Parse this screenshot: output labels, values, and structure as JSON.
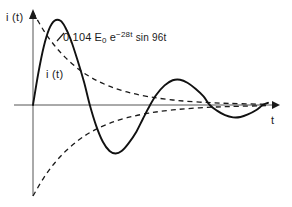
{
  "figure": {
    "background_color": "#ffffff",
    "ink_color": "#1a1a1a"
  },
  "axes": {
    "y_label": "i (t)",
    "t_label": "t",
    "y_arrow": "up-arrow",
    "t_arrow": "right-arrow"
  },
  "annotations": {
    "curve_label": "i (t)",
    "equation": {
      "coefficient": "0,104",
      "amplitude_symbol": "E",
      "amplitude_subscript": "0",
      "exp_base": "e",
      "exp_superscript": "−28t",
      "trig": "sin 96t",
      "full_text": "0,104 E0 e−28t sin 96t"
    }
  },
  "chart_data": {
    "type": "line",
    "title": "",
    "xlabel": "t",
    "ylabel": "i (t)",
    "grid": false,
    "legend": null,
    "axis_origin_px": [
      33,
      105
    ],
    "xlim": [
      0,
      0.175
    ],
    "ylim": [
      -1.05,
      1.05
    ],
    "series": [
      {
        "name": "i (t)",
        "style": "solid",
        "expression": "0,104 E0 e^(-28t) sin 96t",
        "points": [
          [
            0.0,
            0.0
          ],
          [
            0.004,
            0.345
          ],
          [
            0.008,
            0.627
          ],
          [
            0.012,
            0.816
          ],
          [
            0.016,
            0.906
          ],
          [
            0.0205,
            0.906
          ],
          [
            0.024,
            0.836
          ],
          [
            0.028,
            0.707
          ],
          [
            0.033,
            0.489
          ],
          [
            0.038,
            0.246
          ],
          [
            0.0423,
            0.0
          ],
          [
            0.047,
            -0.226
          ],
          [
            0.052,
            -0.404
          ],
          [
            0.057,
            -0.506
          ],
          [
            0.0615,
            -0.533
          ],
          [
            0.066,
            -0.506
          ],
          [
            0.071,
            -0.425
          ],
          [
            0.077,
            -0.293
          ],
          [
            0.0817,
            -0.156
          ],
          [
            0.0872,
            0.0
          ],
          [
            0.092,
            0.113
          ],
          [
            0.098,
            0.211
          ],
          [
            0.104,
            0.266
          ],
          [
            0.1095,
            0.272
          ],
          [
            0.115,
            0.239
          ],
          [
            0.121,
            0.175
          ],
          [
            0.127,
            0.093
          ],
          [
            0.1316,
            0.0
          ],
          [
            0.137,
            -0.062
          ],
          [
            0.143,
            -0.112
          ],
          [
            0.149,
            -0.136
          ],
          [
            0.1545,
            -0.132
          ],
          [
            0.16,
            -0.104
          ],
          [
            0.166,
            -0.058
          ],
          [
            0.1711,
            0.0
          ],
          [
            0.175,
            0.024
          ]
        ]
      },
      {
        "name": "upper envelope",
        "style": "dashed",
        "expression": "+0,104 E0 e^(-28t)",
        "points": [
          [
            0.0,
            1.0
          ],
          [
            0.008,
            0.8
          ],
          [
            0.016,
            0.64
          ],
          [
            0.024,
            0.512
          ],
          [
            0.034,
            0.385
          ],
          [
            0.044,
            0.29
          ],
          [
            0.056,
            0.207
          ],
          [
            0.07,
            0.14
          ],
          [
            0.086,
            0.09
          ],
          [
            0.104,
            0.054
          ],
          [
            0.124,
            0.031
          ],
          [
            0.146,
            0.017
          ],
          [
            0.175,
            0.007
          ]
        ]
      },
      {
        "name": "lower envelope",
        "style": "dashed",
        "expression": "−0,104 E0 e^(-28t)",
        "points": [
          [
            0.0,
            -1.0
          ],
          [
            0.008,
            -0.8
          ],
          [
            0.016,
            -0.64
          ],
          [
            0.024,
            -0.512
          ],
          [
            0.034,
            -0.385
          ],
          [
            0.044,
            -0.29
          ],
          [
            0.056,
            -0.207
          ],
          [
            0.07,
            -0.14
          ],
          [
            0.086,
            -0.09
          ],
          [
            0.104,
            -0.054
          ],
          [
            0.124,
            -0.031
          ],
          [
            0.146,
            -0.017
          ],
          [
            0.175,
            -0.007
          ]
        ]
      }
    ]
  }
}
